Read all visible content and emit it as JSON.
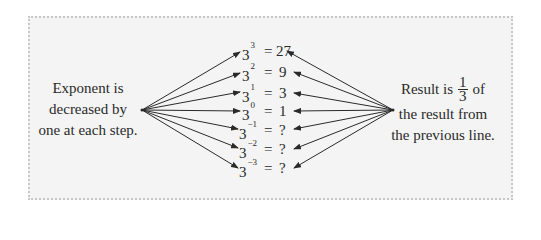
{
  "left_caption": {
    "lines": [
      "Exponent is",
      "decreased by",
      "one at each step."
    ]
  },
  "right_caption": {
    "line1_prefix": "Result is",
    "fraction": {
      "numerator": "1",
      "denominator": "3"
    },
    "line1_suffix": "of",
    "line2": "the result from",
    "line3": "the previous line."
  },
  "equations": [
    {
      "base": "3",
      "exponent": "3",
      "equals": "=",
      "result": "27"
    },
    {
      "base": "3",
      "exponent": "2",
      "equals": "=",
      "result": "9"
    },
    {
      "base": "3",
      "exponent": "1",
      "equals": "=",
      "result": "3"
    },
    {
      "base": "3",
      "exponent": "0",
      "equals": "=",
      "result": "1"
    },
    {
      "base": "3",
      "exponent": "−1",
      "equals": "=",
      "result": "?"
    },
    {
      "base": "3",
      "exponent": "−2",
      "equals": "=",
      "result": "?"
    },
    {
      "base": "3",
      "exponent": "−3",
      "equals": "=",
      "result": "?"
    }
  ],
  "colors": {
    "panel_bg": "#f4f4f4",
    "panel_border": "#c8c8c8",
    "ink": "#2a2a2a"
  }
}
